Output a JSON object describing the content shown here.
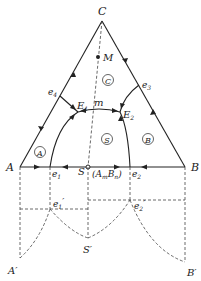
{
  "diagram": {
    "type": "ternary phase diagram with binary compound",
    "vertices": {
      "C": {
        "label": "C",
        "x": 102,
        "y": 21
      },
      "A": {
        "label": "A",
        "x": 20,
        "y": 167
      },
      "B": {
        "label": "B",
        "x": 185,
        "y": 167
      }
    },
    "points": {
      "e1": {
        "label": "e",
        "sub": "1",
        "x": 50,
        "y": 167
      },
      "e2": {
        "label": "e",
        "sub": "2",
        "x": 130,
        "y": 167
      },
      "e3": {
        "label": "e",
        "sub": "3",
        "x": 139,
        "y": 85
      },
      "e4": {
        "label": "e",
        "sub": "4",
        "x": 60,
        "y": 96
      },
      "E1": {
        "label": "E",
        "sub": "1",
        "x": 78,
        "y": 112
      },
      "E2": {
        "label": "E",
        "sub": "2",
        "x": 120,
        "y": 112
      },
      "S": {
        "label": "S",
        "x": 88,
        "y": 167
      },
      "m": {
        "label": "m",
        "x": 95,
        "y": 108
      },
      "M": {
        "label": "M",
        "x": 98,
        "y": 57
      }
    },
    "compound_label": {
      "text": "(A",
      "sub1": "m",
      "mid": "B",
      "sub2": "n",
      "close": ")"
    },
    "fields": [
      {
        "label": "A",
        "x": 40,
        "y": 152
      },
      {
        "label": "S",
        "x": 107,
        "y": 139
      },
      {
        "label": "B",
        "x": 148,
        "y": 139
      },
      {
        "label": "C",
        "x": 108,
        "y": 80
      }
    ],
    "projection": {
      "A_prime": {
        "label": "A",
        "prime": "′",
        "x": 20,
        "y": 258
      },
      "B_prime": {
        "label": "B",
        "prime": "′",
        "x": 185,
        "y": 262
      },
      "S_prime": {
        "label": "S",
        "prime": "′",
        "x": 88,
        "y": 238
      },
      "e1_prime": {
        "label": "e",
        "sub": "1",
        "prime": "′",
        "x": 50,
        "y": 209
      },
      "e2_prime": {
        "label": "e",
        "sub": "2",
        "prime": "′",
        "x": 130,
        "y": 200
      }
    }
  }
}
